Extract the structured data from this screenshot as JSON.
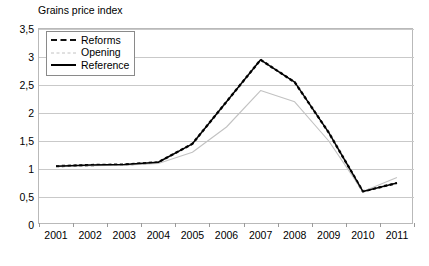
{
  "chart": {
    "title": "Grains price index",
    "caption": ""
  },
  "legend": {
    "position": "top-left",
    "items": [
      {
        "label": "Reforms",
        "style": "dashed",
        "color": "#111111"
      },
      {
        "label": "Opening",
        "style": "dashed-light",
        "color": "#c2c2c2"
      },
      {
        "label": "Reference",
        "style": "solid",
        "color": "#000000"
      }
    ]
  },
  "chart_data": {
    "type": "line",
    "title": "Grains price index",
    "xlabel": "",
    "ylabel": "Grains price index",
    "x": [
      2001,
      2002,
      2003,
      2004,
      2005,
      2006,
      2007,
      2008,
      2009,
      2010,
      2011
    ],
    "xtick_labels": [
      "2001",
      "2002",
      "2003",
      "2004",
      "2005",
      "2006",
      "2007",
      "2008",
      "2009",
      "2010",
      "2011"
    ],
    "ytick_labels": [
      "0",
      "0,5",
      "1",
      "1,5",
      "2",
      "2,5",
      "3",
      "3,5"
    ],
    "yticks": [
      0,
      0.5,
      1,
      1.5,
      2,
      2.5,
      3,
      3.5
    ],
    "ylim": [
      0,
      3.5
    ],
    "grid": true,
    "series": [
      {
        "name": "Reforms",
        "style": "dashed",
        "color": "#111111",
        "values": [
          1.05,
          1.07,
          1.08,
          1.12,
          1.45,
          2.2,
          2.95,
          2.55,
          1.65,
          0.6,
          0.75
        ]
      },
      {
        "name": "Opening",
        "style": "dashed-light",
        "color": "#c2c2c2",
        "values": [
          1.05,
          1.06,
          1.07,
          1.1,
          1.3,
          1.75,
          2.4,
          2.2,
          1.5,
          0.6,
          0.85
        ]
      },
      {
        "name": "Reference",
        "style": "solid",
        "color": "#000000",
        "values": [
          1.05,
          1.07,
          1.08,
          1.12,
          1.45,
          2.2,
          2.95,
          2.55,
          1.65,
          0.6,
          0.75
        ]
      }
    ],
    "peaks": {
      "Reforms": 3.1,
      "Opening": 2.5
    }
  }
}
